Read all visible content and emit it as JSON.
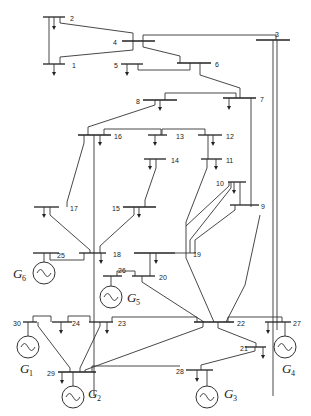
{
  "diagram": {
    "type": "single-line power system diagram",
    "buses": [
      "1",
      "2",
      "3",
      "4",
      "5",
      "6",
      "7",
      "8",
      "9",
      "10",
      "11",
      "12",
      "13",
      "14",
      "15",
      "16",
      "17",
      "18",
      "19",
      "20",
      "21",
      "22",
      "23",
      "24",
      "25",
      "26",
      "27",
      "28",
      "29",
      "30"
    ],
    "generators": [
      {
        "label": "G",
        "sub": "1",
        "bus": "30"
      },
      {
        "label": "G",
        "sub": "2",
        "bus": "29"
      },
      {
        "label": "G",
        "sub": "3",
        "bus": "28"
      },
      {
        "label": "G",
        "sub": "4",
        "bus": "27"
      },
      {
        "label": "G",
        "sub": "5",
        "bus": "26"
      },
      {
        "label": "G",
        "sub": "6",
        "bus": "25"
      }
    ],
    "colors": {
      "line": "#333333",
      "background": "#ffffff"
    }
  }
}
